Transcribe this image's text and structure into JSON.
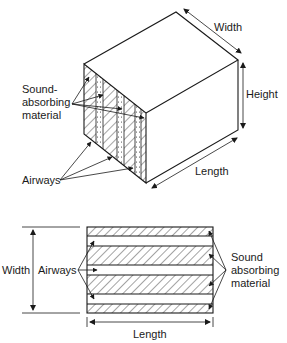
{
  "figure": {
    "type": "diagram",
    "colors": {
      "line": "#1a1a1a",
      "background": "#ffffff"
    }
  },
  "isometric_view": {
    "labels": {
      "width": "Width",
      "height": "Height",
      "length": "Length",
      "sound_absorbing_line1": "Sound-",
      "sound_absorbing_line2": "absorbing",
      "sound_absorbing_line3": "material",
      "airways": "Airways"
    }
  },
  "section_view": {
    "labels": {
      "width": "Width",
      "airways": "Airways",
      "length": "Length",
      "sound_absorbing_line1": "Sound",
      "sound_absorbing_line2": "absorbing",
      "sound_absorbing_line3": "material"
    },
    "layers": [
      "absorber",
      "airway",
      "absorber",
      "airway",
      "absorber",
      "airway",
      "absorber"
    ]
  }
}
